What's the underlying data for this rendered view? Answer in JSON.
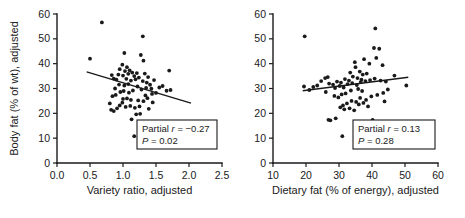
{
  "chart_data": [
    {
      "type": "scatter",
      "panel": "left",
      "title": "",
      "xlabel": "Variety ratio, adjusted",
      "ylabel": "Body fat (% of wt), adjusted",
      "xlim": [
        0.0,
        2.5
      ],
      "ylim": [
        0,
        60
      ],
      "xticks": [
        "0.0",
        "0.5",
        "1.0",
        "1.5",
        "2.0",
        "2.5"
      ],
      "xtick_values": [
        0.0,
        0.5,
        1.0,
        1.5,
        2.0,
        2.5
      ],
      "yticks": [
        "0",
        "10",
        "20",
        "30",
        "40",
        "50",
        "60"
      ],
      "ytick_values": [
        0,
        10,
        20,
        30,
        40,
        50,
        60
      ],
      "grid": false,
      "legend": "none",
      "annotation": {
        "partial_label": "Partial",
        "r_symbol": "r",
        "r_text": " = −0.27",
        "p_symbol": "P",
        "p_text": " = 0.02",
        "partial_r": -0.27,
        "p_value": 0.02
      },
      "fit_line": {
        "x1": 0.45,
        "y1": 36.7,
        "x2": 2.03,
        "y2": 24.1
      },
      "points": [
        [
          0.68,
          56.6
        ],
        [
          0.5,
          42.0
        ],
        [
          1.02,
          44.3
        ],
        [
          1.3,
          51.0
        ],
        [
          1.27,
          43.5
        ],
        [
          1.31,
          41.2
        ],
        [
          0.99,
          39.6
        ],
        [
          1.06,
          38.6
        ],
        [
          0.95,
          37.8
        ],
        [
          1.03,
          37.0
        ],
        [
          1.1,
          37.3
        ],
        [
          1.14,
          36.4
        ],
        [
          1.08,
          35.9
        ],
        [
          1.0,
          35.2
        ],
        [
          0.93,
          35.6
        ],
        [
          1.17,
          35.0
        ],
        [
          1.21,
          36.2
        ],
        [
          1.24,
          34.4
        ],
        [
          0.86,
          34.0
        ],
        [
          0.9,
          33.6
        ],
        [
          1.05,
          33.9
        ],
        [
          1.12,
          33.2
        ],
        [
          1.19,
          33.7
        ],
        [
          0.83,
          35.4
        ],
        [
          1.33,
          36.0
        ],
        [
          1.38,
          34.6
        ],
        [
          1.7,
          37.2
        ],
        [
          1.6,
          31.0
        ],
        [
          1.66,
          29.1
        ],
        [
          1.72,
          29.4
        ],
        [
          1.41,
          31.5
        ],
        [
          1.35,
          30.2
        ],
        [
          1.28,
          29.6
        ],
        [
          1.22,
          30.8
        ],
        [
          1.15,
          29.2
        ],
        [
          1.09,
          28.3
        ],
        [
          1.01,
          29.0
        ],
        [
          0.96,
          28.6
        ],
        [
          0.89,
          27.4
        ],
        [
          0.84,
          26.9
        ],
        [
          0.8,
          24.0
        ],
        [
          0.82,
          21.4
        ],
        [
          0.86,
          20.9
        ],
        [
          0.95,
          23.2
        ],
        [
          0.99,
          24.3
        ],
        [
          1.04,
          22.6
        ],
        [
          1.11,
          23.0
        ],
        [
          1.18,
          22.2
        ],
        [
          1.25,
          22.8
        ],
        [
          1.31,
          24.9
        ],
        [
          1.37,
          26.1
        ],
        [
          1.44,
          27.8
        ],
        [
          1.5,
          28.2
        ],
        [
          1.45,
          24.4
        ],
        [
          1.39,
          21.8
        ],
        [
          1.26,
          19.8
        ],
        [
          1.2,
          19.6
        ],
        [
          1.13,
          17.6
        ],
        [
          1.17,
          10.8
        ],
        [
          1.52,
          12.6
        ],
        [
          1.08,
          31.8
        ],
        [
          1.02,
          31.2
        ],
        [
          0.94,
          31.6
        ],
        [
          1.3,
          33.0
        ],
        [
          1.36,
          32.4
        ],
        [
          1.43,
          29.9
        ],
        [
          1.55,
          30.4
        ],
        [
          0.88,
          30.0
        ],
        [
          1.06,
          26.0
        ],
        [
          1.12,
          25.4
        ],
        [
          1.0,
          25.8
        ],
        [
          1.23,
          25.2
        ],
        [
          1.34,
          27.2
        ],
        [
          0.91,
          22.0
        ],
        [
          1.47,
          33.4
        ]
      ]
    },
    {
      "type": "scatter",
      "panel": "right",
      "title": "",
      "xlabel": "Dietary fat (% of energy), adjusted",
      "ylabel": "Body fat (% of wt), adjusted",
      "xlim": [
        10,
        60
      ],
      "ylim": [
        0,
        60
      ],
      "xticks": [
        "10",
        "20",
        "30",
        "40",
        "50",
        "60"
      ],
      "xtick_values": [
        10,
        20,
        30,
        40,
        50,
        60
      ],
      "yticks": [
        "0",
        "10",
        "20",
        "30",
        "40",
        "50",
        "60"
      ],
      "ytick_values": [
        0,
        10,
        20,
        30,
        40,
        50,
        60
      ],
      "grid": false,
      "legend": "none",
      "annotation": {
        "partial_label": "Partial",
        "r_symbol": "r",
        "r_text": " = 0.13",
        "p_symbol": "P",
        "p_text": " = 0.28",
        "partial_r": 0.13,
        "p_value": 0.28
      },
      "fit_line": {
        "x1": 19.0,
        "y1": 29.1,
        "x2": 51.0,
        "y2": 34.5
      },
      "points": [
        [
          19.6,
          51.0
        ],
        [
          41.0,
          54.2
        ],
        [
          40.6,
          46.3
        ],
        [
          42.2,
          46.0
        ],
        [
          41.3,
          42.3
        ],
        [
          37.6,
          41.8
        ],
        [
          34.8,
          40.6
        ],
        [
          35.0,
          38.6
        ],
        [
          39.2,
          40.0
        ],
        [
          43.2,
          39.4
        ],
        [
          33.4,
          36.4
        ],
        [
          36.3,
          36.8
        ],
        [
          37.2,
          35.6
        ],
        [
          38.4,
          36.0
        ],
        [
          34.2,
          34.8
        ],
        [
          35.6,
          34.2
        ],
        [
          36.8,
          33.6
        ],
        [
          33.0,
          33.2
        ],
        [
          31.8,
          33.8
        ],
        [
          30.6,
          32.4
        ],
        [
          29.4,
          32.8
        ],
        [
          28.2,
          31.6
        ],
        [
          27.0,
          32.0
        ],
        [
          25.8,
          34.2
        ],
        [
          26.6,
          34.6
        ],
        [
          24.6,
          33.0
        ],
        [
          23.4,
          31.2
        ],
        [
          22.2,
          30.6
        ],
        [
          19.4,
          30.8
        ],
        [
          21.0,
          29.4
        ],
        [
          26.0,
          28.6
        ],
        [
          28.8,
          30.2
        ],
        [
          30.2,
          31.0
        ],
        [
          31.4,
          30.4
        ],
        [
          32.6,
          31.8
        ],
        [
          34.0,
          32.2
        ],
        [
          35.4,
          31.4
        ],
        [
          36.6,
          32.6
        ],
        [
          38.0,
          33.0
        ],
        [
          39.4,
          33.4
        ],
        [
          40.8,
          34.0
        ],
        [
          42.6,
          33.2
        ],
        [
          44.2,
          32.8
        ],
        [
          46.8,
          35.2
        ],
        [
          50.4,
          31.2
        ],
        [
          44.8,
          29.6
        ],
        [
          43.4,
          28.2
        ],
        [
          41.6,
          27.4
        ],
        [
          39.8,
          26.8
        ],
        [
          38.2,
          25.4
        ],
        [
          36.4,
          26.2
        ],
        [
          35.2,
          24.6
        ],
        [
          33.8,
          25.0
        ],
        [
          32.4,
          24.0
        ],
        [
          31.2,
          23.2
        ],
        [
          30.4,
          22.4
        ],
        [
          31.6,
          21.6
        ],
        [
          33.2,
          22.0
        ],
        [
          34.6,
          21.2
        ],
        [
          36.0,
          23.6
        ],
        [
          37.4,
          24.2
        ],
        [
          38.8,
          22.8
        ],
        [
          30.8,
          27.6
        ],
        [
          32.0,
          28.0
        ],
        [
          29.8,
          26.4
        ],
        [
          28.6,
          27.0
        ],
        [
          26.8,
          17.4
        ],
        [
          27.4,
          17.2
        ],
        [
          29.0,
          18.0
        ],
        [
          40.2,
          17.4
        ],
        [
          31.0,
          10.8
        ],
        [
          37.0,
          29.0
        ],
        [
          35.8,
          29.8
        ],
        [
          33.6,
          29.2
        ],
        [
          43.8,
          24.8
        ]
      ]
    }
  ]
}
